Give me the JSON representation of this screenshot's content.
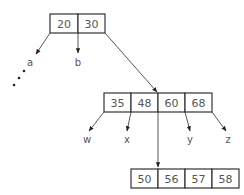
{
  "diagram": {
    "type": "b-tree",
    "nodes": {
      "root": {
        "keys": [
          "20",
          "30"
        ]
      },
      "child": {
        "keys": [
          "35",
          "48",
          "60",
          "68"
        ]
      },
      "grandchild": {
        "keys": [
          "50",
          "56",
          "57",
          "58"
        ]
      }
    },
    "pointer_labels": {
      "a": "a",
      "b": "b",
      "w": "w",
      "x": "x",
      "y": "y",
      "z": "z"
    },
    "ellipsis": "…",
    "colors": {
      "stroke": "#333333",
      "text": "#555555",
      "background": "#ffffff"
    }
  }
}
